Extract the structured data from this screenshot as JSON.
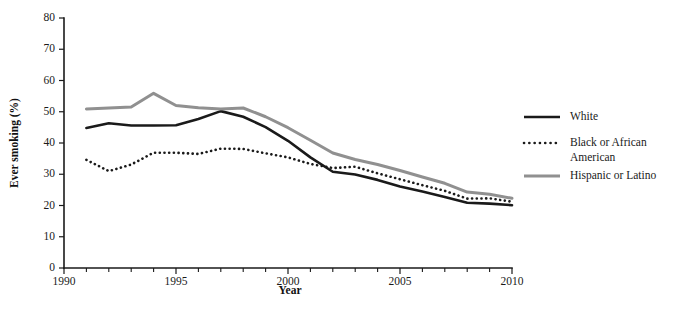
{
  "chart_data": {
    "type": "line",
    "title": "",
    "xlabel": "Year",
    "ylabel": "Ever smoking (%)",
    "xlim": [
      1990,
      2010
    ],
    "ylim": [
      0,
      80
    ],
    "grid": false,
    "legend_position": "right",
    "x_ticks_major": [
      1990,
      1995,
      2000,
      2005,
      2010
    ],
    "x_tick_labels": [
      "1990",
      "1995",
      "2000",
      "2005",
      "2010"
    ],
    "x_ticks_minor": [
      1991,
      1992,
      1993,
      1994,
      1996,
      1997,
      1998,
      1999,
      2001,
      2002,
      2003,
      2004,
      2006,
      2007,
      2008,
      2009
    ],
    "y_ticks": [
      0,
      10,
      20,
      30,
      40,
      50,
      60,
      70,
      80
    ],
    "y_tick_labels": [
      "0",
      "10",
      "20",
      "30",
      "40",
      "50",
      "60",
      "70",
      "80"
    ],
    "x": [
      1991,
      1992,
      1993,
      1994,
      1995,
      1996,
      1997,
      1998,
      1999,
      2000,
      2001,
      2002,
      2003,
      2004,
      2005,
      2006,
      2007,
      2008,
      2009,
      2010
    ],
    "series": [
      {
        "name": "White",
        "color": "#1a1a1a",
        "style": "solid",
        "width": 2.6,
        "values": [
          44.8,
          46.3,
          45.6,
          45.6,
          45.7,
          47.7,
          50.2,
          48.4,
          45.1,
          40.7,
          35.4,
          30.8,
          29.9,
          28.2,
          26.1,
          24.5,
          22.7,
          20.9,
          20.6,
          20.1
        ]
      },
      {
        "name": "Black or African American",
        "color": "#1a1a1a",
        "style": "dotted",
        "width": 2.6,
        "values": [
          34.6,
          31.0,
          33.1,
          36.9,
          36.9,
          36.5,
          38.2,
          38.1,
          36.7,
          35.4,
          33.3,
          32.0,
          32.4,
          30.3,
          28.4,
          26.5,
          24.7,
          22.2,
          22.3,
          21.2
        ]
      },
      {
        "name": "Hispanic or Latino",
        "color": "#909090",
        "style": "solid",
        "width": 3.0,
        "values": [
          50.9,
          51.2,
          51.5,
          55.9,
          52.0,
          51.3,
          50.9,
          51.2,
          48.4,
          44.9,
          40.9,
          36.8,
          34.7,
          33.1,
          31.2,
          29.1,
          27.1,
          24.3,
          23.6,
          22.3
        ]
      }
    ]
  },
  "legend": {
    "items": [
      {
        "label": "White",
        "label2": "",
        "swatch": "solid-black"
      },
      {
        "label": "Black or African",
        "label2": "American",
        "swatch": "dotted-black"
      },
      {
        "label": "Hispanic or Latino",
        "label2": "",
        "swatch": "solid-gray"
      }
    ]
  }
}
